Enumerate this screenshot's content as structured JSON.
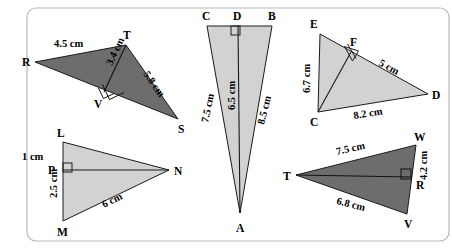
{
  "figure": {
    "colors": {
      "dark_fill": "#6d6d6d",
      "light_fill": "#d2d2d2",
      "stroke": "#1a1a1a",
      "panel_border": "#b8b8b8",
      "background": "#ffffff"
    },
    "triangles": [
      {
        "id": "rts",
        "name": "triangle-rts",
        "shade": "dark",
        "vertices": [
          {
            "label": "R",
            "x": 35,
            "y": 62
          },
          {
            "label": "T",
            "x": 126,
            "y": 45
          },
          {
            "label": "S",
            "x": 178,
            "y": 119
          }
        ],
        "foot": {
          "label": "V",
          "x": 104,
          "y": 92
        },
        "measures": [
          {
            "label": "4.5 cm",
            "side": "RT"
          },
          {
            "label": "3.4 cm",
            "side": "TV"
          },
          {
            "label": "5.8 cm",
            "side": "TS"
          }
        ]
      },
      {
        "id": "cba",
        "name": "triangle-cba",
        "shade": "light",
        "vertices": [
          {
            "label": "C",
            "x": 207,
            "y": 26
          },
          {
            "label": "B",
            "x": 272,
            "y": 26
          },
          {
            "label": "A",
            "x": 240,
            "y": 213
          }
        ],
        "foot": {
          "label": "D",
          "x": 238,
          "y": 26
        },
        "measures": [
          {
            "label": "7.5 cm",
            "side": "CA"
          },
          {
            "label": "6.5 cm",
            "side": "DA"
          },
          {
            "label": "8.5 cm",
            "side": "BA"
          }
        ]
      },
      {
        "id": "ecd",
        "name": "triangle-ecd",
        "shade": "light",
        "vertices": [
          {
            "label": "E",
            "x": 320,
            "y": 34
          },
          {
            "label": "D",
            "x": 428,
            "y": 94
          },
          {
            "label": "C",
            "x": 318,
            "y": 112
          }
        ],
        "foot": {
          "label": "F",
          "x": 351,
          "y": 52
        },
        "measures": [
          {
            "label": "6.7 cm",
            "side": "EC"
          },
          {
            "label": "5 cm",
            "side": "FD"
          },
          {
            "label": "8.2 cm",
            "side": "CD"
          }
        ]
      },
      {
        "id": "lmn",
        "name": "triangle-lmn",
        "shade": "light",
        "vertices": [
          {
            "label": "L",
            "x": 63,
            "y": 142
          },
          {
            "label": "M",
            "x": 63,
            "y": 221
          },
          {
            "label": "N",
            "x": 169,
            "y": 170
          }
        ],
        "foot": {
          "label": "P",
          "x": 63,
          "y": 170
        },
        "measures": [
          {
            "label": "1 cm",
            "side": "LP"
          },
          {
            "label": "2.5 cm",
            "side": "PM"
          },
          {
            "label": "6 cm",
            "side": "MN"
          }
        ]
      },
      {
        "id": "twv",
        "name": "triangle-twv",
        "shade": "dark",
        "vertices": [
          {
            "label": "T",
            "x": 296,
            "y": 175
          },
          {
            "label": "W",
            "x": 416,
            "y": 145
          },
          {
            "label": "V",
            "x": 407,
            "y": 214
          }
        ],
        "foot": {
          "label": "R",
          "x": 412,
          "y": 177
        },
        "measures": [
          {
            "label": "7.5 cm",
            "side": "TW"
          },
          {
            "label": "4.2 cm",
            "side": "WR"
          },
          {
            "label": "6.8 cm",
            "side": "TV"
          }
        ]
      }
    ]
  }
}
